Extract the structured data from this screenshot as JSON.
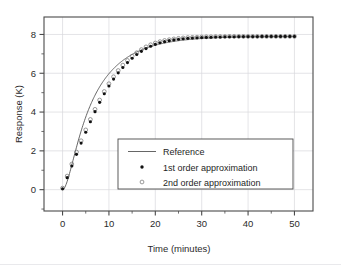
{
  "chart_data": {
    "type": "line",
    "title": "",
    "xlabel": "Time (minutes)",
    "ylabel": "Response (K)",
    "xlim": [
      -4,
      54
    ],
    "ylim": [
      -1.1,
      8.9
    ],
    "xticks": [
      0,
      10,
      20,
      30,
      40,
      50
    ],
    "yticks": [
      0,
      2,
      4,
      6,
      8
    ],
    "xticklabels": [
      "0",
      "10",
      "20",
      "30",
      "40",
      "50"
    ],
    "yticklabels": [
      "0",
      "2",
      "4",
      "6",
      "8"
    ],
    "x_minor_step": 5,
    "y_minor_step": 1,
    "grid": true,
    "legend_position": "center-right",
    "steady_state": 7.9,
    "time_constant": 7.0,
    "series": [
      {
        "name": "Reference",
        "style": "line",
        "x": [
          0,
          1,
          2,
          3,
          4,
          5,
          6,
          7,
          8,
          9,
          10,
          11,
          12,
          13,
          14,
          15,
          16,
          17,
          18,
          19,
          20,
          21,
          22,
          23,
          24,
          25,
          26,
          27,
          28,
          29,
          30,
          31,
          32,
          33,
          34,
          35,
          36,
          37,
          38,
          39,
          40,
          41,
          42,
          43,
          44,
          45,
          46,
          47,
          48,
          49,
          50
        ],
        "y": [
          0.0,
          0.35,
          0.85,
          1.42,
          2.02,
          2.62,
          3.2,
          3.74,
          4.25,
          4.72,
          5.15,
          5.54,
          5.89,
          6.2,
          6.48,
          6.73,
          6.95,
          7.14,
          7.3,
          7.44,
          7.55,
          7.63,
          7.7,
          7.74,
          7.78,
          7.81,
          7.83,
          7.85,
          7.86,
          7.87,
          7.88,
          7.88,
          7.89,
          7.89,
          7.89,
          7.89,
          7.9,
          7.9,
          7.9,
          7.9,
          7.9,
          7.9,
          7.9,
          7.9,
          7.9,
          7.9,
          7.9,
          7.9,
          7.9,
          7.9,
          7.9
        ]
      },
      {
        "name": "1st order approximation",
        "style": "filled-dot",
        "x": [
          0,
          1,
          2,
          3,
          4,
          5,
          6,
          7,
          8,
          9,
          10,
          11,
          12,
          13,
          14,
          15,
          16,
          17,
          18,
          19,
          20,
          21,
          22,
          23,
          24,
          25,
          26,
          27,
          28,
          29,
          30,
          31,
          32,
          33,
          34,
          35,
          36,
          37,
          38,
          39,
          40,
          41,
          42,
          43,
          44,
          45,
          46,
          47,
          48,
          49,
          50
        ],
        "y": [
          0.05,
          0.62,
          1.22,
          1.82,
          2.4,
          2.96,
          3.5,
          4.02,
          4.5,
          4.94,
          5.34,
          5.7,
          6.02,
          6.3,
          6.55,
          6.77,
          6.97,
          7.13,
          7.27,
          7.39,
          7.49,
          7.57,
          7.63,
          7.68,
          7.72,
          7.75,
          7.78,
          7.8,
          7.82,
          7.83,
          7.84,
          7.85,
          7.86,
          7.87,
          7.87,
          7.88,
          7.88,
          7.88,
          7.89,
          7.89,
          7.89,
          7.89,
          7.89,
          7.9,
          7.9,
          7.9,
          7.9,
          7.9,
          7.9,
          7.9,
          7.9
        ]
      },
      {
        "name": "2nd order approximation",
        "style": "open-circle",
        "x": [
          0,
          1,
          2,
          3,
          4,
          5,
          6,
          7,
          8,
          9,
          10,
          11,
          12,
          13,
          14,
          15,
          16,
          17,
          18,
          19,
          20,
          21,
          22,
          23,
          24,
          25,
          26,
          27,
          28,
          29,
          30,
          31,
          32,
          33,
          34,
          35,
          36,
          37,
          38,
          39,
          40,
          41,
          42,
          43,
          44,
          45,
          46,
          47,
          48,
          49,
          50
        ],
        "y": [
          0.08,
          0.7,
          1.32,
          1.94,
          2.52,
          3.08,
          3.62,
          4.14,
          4.62,
          5.06,
          5.46,
          5.82,
          6.14,
          6.42,
          6.66,
          6.88,
          7.06,
          7.22,
          7.36,
          7.47,
          7.56,
          7.63,
          7.69,
          7.73,
          7.77,
          7.8,
          7.82,
          7.84,
          7.85,
          7.86,
          7.87,
          7.88,
          7.88,
          7.89,
          7.89,
          7.89,
          7.9,
          7.9,
          7.9,
          7.9,
          7.9,
          7.9,
          7.9,
          7.9,
          7.9,
          7.9,
          7.9,
          7.9,
          7.9,
          7.9,
          7.9
        ]
      }
    ]
  },
  "legend": {
    "items": [
      {
        "label": "Reference",
        "marker": "line"
      },
      {
        "label": "1st order approximation",
        "marker": "filled-dot"
      },
      {
        "label": "2nd order approximation",
        "marker": "open-circle"
      }
    ]
  },
  "colors": {
    "reference_line": "#555555",
    "first_order_marker": "#111111",
    "second_order_marker": "#6f6f6f",
    "axis": "#4a4a4a",
    "grid": "#d8d8dc",
    "background": "#ffffff"
  }
}
